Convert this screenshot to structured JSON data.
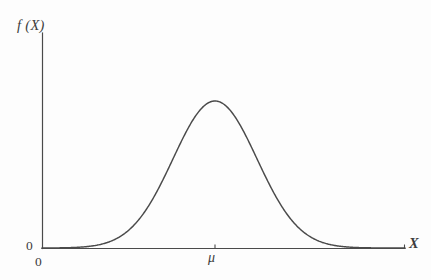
{
  "figure": {
    "background_color": "#fdfdfd",
    "line_color": "#4a4a4a",
    "text_color": "#3d3d3d",
    "width": 431,
    "height": 280
  },
  "labels": {
    "y_axis": "f (X)",
    "x_axis": "X",
    "origin_y": "0",
    "origin_x": "0",
    "mean_tick": "μ"
  },
  "chart_data": {
    "type": "line",
    "title": "",
    "subtitle": "",
    "xlabel": "X",
    "ylabel": "f (X)",
    "grid": false,
    "legend": "none",
    "annotations": [
      {
        "text": "μ",
        "axis": "x",
        "position": "mean",
        "has_tick": true
      },
      {
        "text": "0",
        "axis": "y",
        "position": "origin"
      },
      {
        "text": "0",
        "axis": "x",
        "position": "origin"
      }
    ],
    "curve": {
      "name": "normal probability density",
      "distribution": "normal",
      "mean_label": "μ",
      "mean_x_pixel": 215,
      "peak_y_pixel": 101,
      "baseline_y_pixel": 248,
      "sigma_pixels": 42
    },
    "axis_pixels": {
      "x_start": 42,
      "x_end": 405,
      "y_top": 33,
      "y_baseline": 248
    },
    "x": [
      42,
      60,
      80,
      100,
      110,
      120,
      130,
      140,
      150,
      160,
      170,
      180,
      190,
      200,
      210,
      215,
      220,
      230,
      240,
      250,
      260,
      270,
      280,
      290,
      300,
      310,
      320,
      330,
      350,
      370,
      390,
      405
    ],
    "y": [
      248.0,
      248.0,
      247.9,
      247.5,
      247.0,
      245.9,
      243.8,
      240.1,
      234.2,
      225.4,
      213.5,
      198.4,
      180.8,
      161.9,
      143.8,
      135.6,
      128.2,
      117.0,
      108.2,
      103.3,
      101.3,
      103.3,
      108.2,
      117.0,
      128.2,
      143.8,
      161.9,
      180.8,
      213.5,
      234.2,
      244.8,
      247.5
    ],
    "xlim": [
      42,
      405
    ],
    "ylim": [
      248,
      101
    ]
  }
}
